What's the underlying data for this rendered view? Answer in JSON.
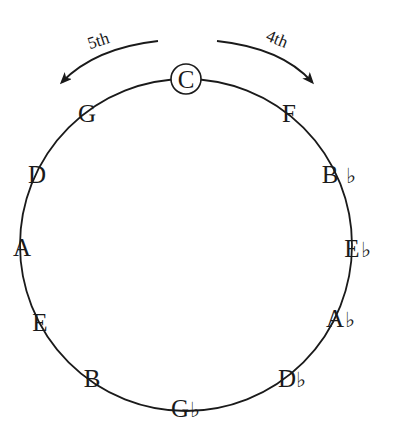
{
  "center_note": "C",
  "directions": {
    "left": "5th",
    "right": "4th"
  },
  "notes": {
    "C": "C",
    "F": "F",
    "Bb": "B",
    "Eb": "E",
    "Ab": "A",
    "Db": "D",
    "Gb": "G",
    "B": "B",
    "E": "E",
    "A": "A",
    "D": "D",
    "G": "G"
  },
  "flat_symbol": "♭",
  "colors": {
    "line": "#1a1a1a",
    "background": "#ffffff"
  }
}
